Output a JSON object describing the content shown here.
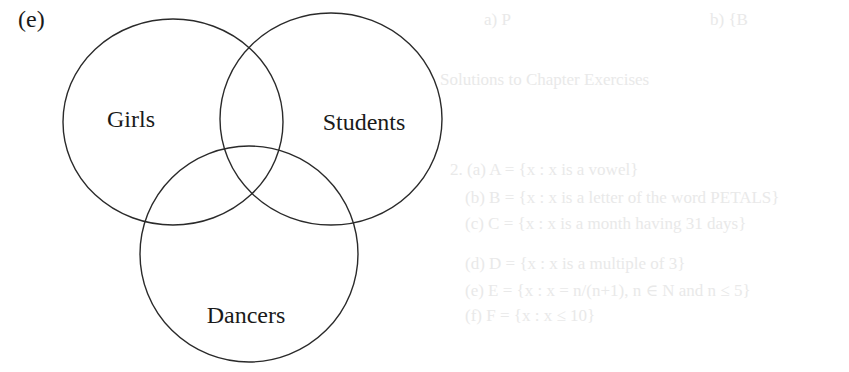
{
  "part_label": "(e)",
  "diagram": {
    "type": "venn",
    "stroke_color": "#2a2a2a",
    "sets": [
      {
        "label": "Girls",
        "cx": 173,
        "cy": 122,
        "rx": 110,
        "ry": 103,
        "label_x": 131,
        "label_y": 127
      },
      {
        "label": "Students",
        "cx": 331,
        "cy": 119,
        "rx": 111,
        "ry": 106,
        "label_x": 364,
        "label_y": 130
      },
      {
        "label": "Dancers",
        "cx": 249,
        "cy": 254,
        "rx": 109,
        "ry": 108,
        "label_x": 246,
        "label_y": 323
      }
    ]
  },
  "bleed_through_text": [
    {
      "text": "a)  P",
      "x": 484,
      "y": 10
    },
    {
      "text": "b)  {B",
      "x": 710,
      "y": 10
    },
    {
      "text": "Solutions to Chapter Exercises",
      "x": 440,
      "y": 70
    },
    {
      "text": "2.  (a)  A = {x : x is a vowel}",
      "x": 450,
      "y": 160
    },
    {
      "text": "(b)  B = {x : x is a letter of the word PETALS}",
      "x": 465,
      "y": 188
    },
    {
      "text": "(c)  C = {x : x is a month having 31 days}",
      "x": 465,
      "y": 214
    },
    {
      "text": "(d)  D = {x : x is a multiple of 3}",
      "x": 465,
      "y": 254
    },
    {
      "text": "(e)  E = {x : x = n/(n+1), n ∈ N and n ≤ 5}",
      "x": 465,
      "y": 280
    },
    {
      "text": "(f)  F = {x : x ≤ 10}",
      "x": 465,
      "y": 306
    }
  ]
}
